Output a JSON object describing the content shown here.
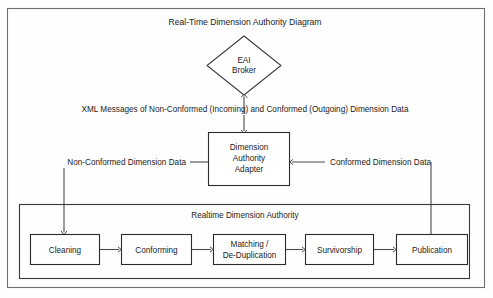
{
  "diagram": {
    "title": "Real-Time Dimension Authority Diagram",
    "broker": {
      "line1": "EAI",
      "line2": "Broker"
    },
    "bus_label": "XML Messages of Non-Conformed (Incoming) and Conformed (Outgoing) Dimension Data",
    "adapter": {
      "line1": "Dimension",
      "line2": "Authority",
      "line3": "Adapter"
    },
    "input_label": "Non-Conformed Dimension Data",
    "output_label": "Conformed Dimension Data",
    "group_title": "Realtime Dimension Authority",
    "steps": [
      {
        "id": "cleaning",
        "line1": "Cleaning",
        "line2": ""
      },
      {
        "id": "conforming",
        "line1": "Conforming",
        "line2": ""
      },
      {
        "id": "matching",
        "line1": "Matching /",
        "line2": "De-Duplication"
      },
      {
        "id": "survivorship",
        "line1": "Survivorship",
        "line2": ""
      },
      {
        "id": "publication",
        "line1": "Publication",
        "line2": ""
      }
    ]
  },
  "colors": {
    "stroke": "#2b2b2b",
    "frame": "#6f6f6f",
    "text": "#1b1b1b",
    "background": "#ffffff"
  }
}
